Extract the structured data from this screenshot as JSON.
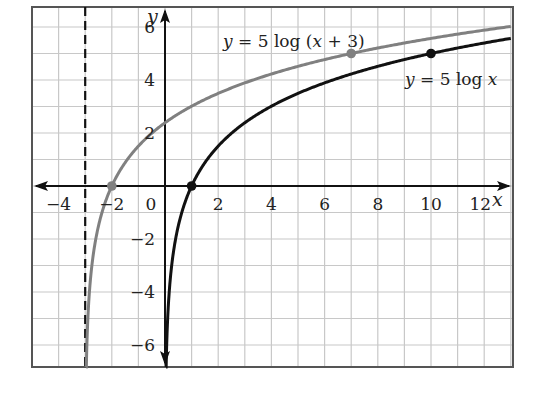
{
  "chart_data": {
    "type": "line",
    "title": "",
    "xlabel": "x",
    "ylabel": "y",
    "xlim": [
      -5,
      13
    ],
    "ylim": [
      -6.8,
      6.75
    ],
    "grid": true,
    "grid_step": 1,
    "x_ticks": [
      -4,
      -2,
      0,
      2,
      4,
      6,
      8,
      10,
      12
    ],
    "x_tick_labels": [
      "−4",
      "−2",
      "0",
      "2",
      "4",
      "6",
      "8",
      "10",
      "12"
    ],
    "y_ticks": [
      6,
      4,
      2,
      -2,
      -4,
      -6
    ],
    "y_tick_labels": [
      "6",
      "4",
      "2",
      "−2",
      "−4",
      "−6"
    ],
    "asymptote": {
      "x": -3,
      "style": "dashed",
      "color": "#111111"
    },
    "series": [
      {
        "name": "y = 5 log (x + 3)",
        "formula": "5*log10(x+3)",
        "color": "#808080",
        "label": "y = 5 log (x + 3)",
        "label_pos": [
          223,
          47
        ],
        "points": [
          [
            -2,
            0
          ],
          [
            7,
            5
          ]
        ],
        "sample": [
          [
            -2.9,
            -5.0
          ],
          [
            -2.5,
            -1.51
          ],
          [
            -2,
            0
          ],
          [
            -1,
            1.51
          ],
          [
            0,
            2.39
          ],
          [
            1,
            3.01
          ],
          [
            2,
            3.49
          ],
          [
            4,
            4.23
          ],
          [
            7,
            5.0
          ],
          [
            10,
            5.57
          ],
          [
            13,
            6.02
          ]
        ]
      },
      {
        "name": "y = 5 log x",
        "formula": "5*log10(x)",
        "color": "#111111",
        "label": "y = 5 log x",
        "label_pos": [
          405,
          85
        ],
        "points": [
          [
            1,
            0
          ],
          [
            10,
            5
          ]
        ],
        "sample": [
          [
            0.1,
            -5.0
          ],
          [
            0.5,
            -1.51
          ],
          [
            1,
            0
          ],
          [
            2,
            1.51
          ],
          [
            4,
            3.01
          ],
          [
            6,
            3.89
          ],
          [
            8,
            4.52
          ],
          [
            10,
            5.0
          ],
          [
            12,
            5.4
          ],
          [
            13,
            5.57
          ]
        ]
      }
    ],
    "legend": "inline labels"
  },
  "labels": {
    "x_axis": "x",
    "y_axis": "y",
    "curve_shifted": "y = 5 log (x + 3)",
    "curve_base": "y = 5 log x"
  }
}
